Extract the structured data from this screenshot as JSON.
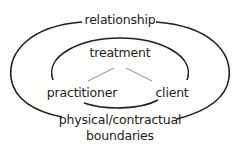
{
  "diagram": {
    "outer_label": "relationship",
    "inner_label": "treatment",
    "left_node": "practitioner",
    "right_node": "client",
    "bottom_label_line1": "physical/contractual",
    "bottom_label_line2": "boundaries"
  },
  "colors": {
    "stroke": "#1e1e1e",
    "connector": "#8a8a8a",
    "background": "#fdfdfc"
  }
}
